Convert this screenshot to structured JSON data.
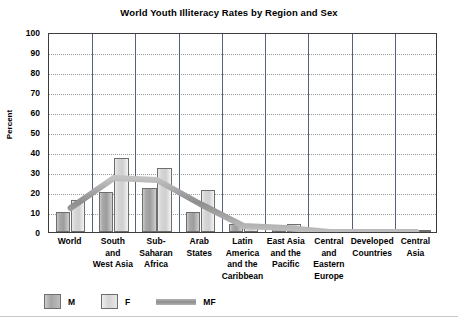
{
  "chart_data": {
    "type": "bar",
    "title": "World Youth Illiteracy Rates by Region and Sex",
    "xlabel": "",
    "ylabel": "Percent",
    "ylim": [
      0,
      100
    ],
    "ytick_step": 10,
    "yticks": [
      "100",
      "90",
      "80",
      "70",
      "60",
      "50",
      "40",
      "30",
      "20",
      "10",
      "0"
    ],
    "grid": true,
    "legend_position": "bottom-left",
    "categories": [
      "World",
      "South and West Asia",
      "Sub-Saharan Africa",
      "Arab States",
      "Latin America and the Caribbean",
      "East Asia and the Pacific",
      "Central and Eastern Europe",
      "Developed Countries",
      "Central Asia"
    ],
    "category_lines": [
      [
        "World"
      ],
      [
        "South",
        "and",
        "West Asia"
      ],
      [
        "Sub-",
        "Saharan",
        "Africa"
      ],
      [
        "Arab",
        "States"
      ],
      [
        "Latin",
        "America",
        "and the",
        "Caribbean"
      ],
      [
        "East Asia",
        "and the",
        "Pacific"
      ],
      [
        "Central",
        "and",
        "Eastern",
        "Europe"
      ],
      [
        "Developed",
        "Countries"
      ],
      [
        "Central",
        "Asia"
      ]
    ],
    "series": [
      {
        "name": "M",
        "values": [
          10,
          20,
          22,
          10,
          4,
          2,
          1,
          1,
          1
        ]
      },
      {
        "name": "F",
        "values": [
          16,
          37,
          32,
          21,
          4,
          4,
          1,
          1,
          1
        ]
      },
      {
        "name": "MF",
        "values": [
          13,
          28,
          27,
          15,
          4,
          3,
          1,
          1,
          1
        ]
      }
    ],
    "colors": {
      "m": "#a8a8a8",
      "f": "#d9d9d9",
      "mf": "#9b9b9b",
      "frame": "#3d3d3d",
      "grid": "#9a9a9a",
      "separator": "#55607a"
    }
  },
  "legend": {
    "items": [
      {
        "label": "M",
        "type": "swatch-dark"
      },
      {
        "label": "F",
        "type": "swatch-light"
      },
      {
        "label": "MF",
        "type": "line"
      }
    ]
  }
}
